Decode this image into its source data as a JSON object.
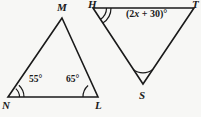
{
  "figure": {
    "kind": "geometry-diagram",
    "background_color": "#f7f7f5",
    "stroke_color": "#1a1a1a",
    "triangles": [
      {
        "name": "triangle-MNL",
        "vertices": [
          {
            "label": "M",
            "x": 62,
            "y": 18
          },
          {
            "label": "N",
            "x": 8,
            "y": 97
          },
          {
            "label": "L",
            "x": 98,
            "y": 97
          }
        ],
        "angles": [
          {
            "at": "N",
            "value": "55°",
            "arcs": 2
          },
          {
            "at": "L",
            "value": "65°",
            "arcs": 1
          }
        ]
      },
      {
        "name": "triangle-HTS",
        "vertices": [
          {
            "label": "H",
            "x": 93,
            "y": 8
          },
          {
            "label": "T",
            "x": 194,
            "y": 8
          },
          {
            "label": "S",
            "x": 143,
            "y": 84
          }
        ],
        "angles": [
          {
            "at": "H",
            "value": "",
            "arcs": 2
          },
          {
            "at": "T",
            "value": "(2x + 30)°",
            "arcs": 0
          },
          {
            "at": "S",
            "value": "",
            "arcs": 1
          }
        ]
      }
    ],
    "labels": {
      "M": "M",
      "N": "N",
      "L": "L",
      "H": "H",
      "T": "T",
      "S": "S",
      "angle_N": "55°",
      "angle_L": "65°",
      "angle_T_prefix": "(2",
      "angle_T_var": "x",
      "angle_T_suffix": " + 30)°"
    }
  }
}
